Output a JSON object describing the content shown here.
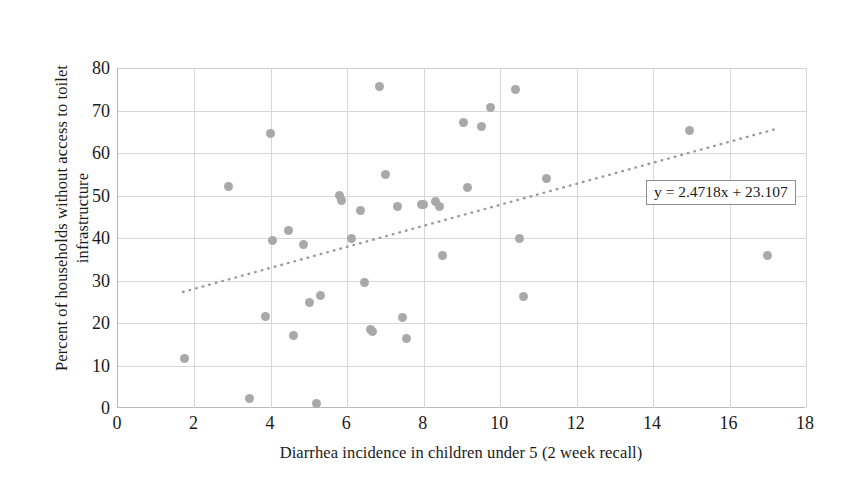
{
  "chart_data": {
    "type": "scatter",
    "title": "",
    "xlabel": "Diarrhea incidence in children under 5 (2 week recall)",
    "ylabel_line1": "Percent of households without access to toilet",
    "ylabel_line2": "infrastructure",
    "xlim": [
      0,
      18
    ],
    "ylim": [
      0,
      80
    ],
    "xticks": [
      0,
      2,
      4,
      6,
      8,
      10,
      12,
      14,
      16,
      18
    ],
    "yticks": [
      0,
      10,
      20,
      30,
      40,
      50,
      60,
      70,
      80
    ],
    "grid": true,
    "legend": "none",
    "marker_color": "#a9a9a9",
    "gridline_color": "#d6d6d6",
    "trendline": {
      "equation": "y = 2.4718x + 23.107",
      "slope": 2.4718,
      "intercept": 23.107,
      "style": "dotted",
      "color": "#9a9a9a",
      "x_start": 1.7,
      "x_end": 17.2
    },
    "points": [
      {
        "x": 1.75,
        "y": 11.7
      },
      {
        "x": 2.9,
        "y": 52.2
      },
      {
        "x": 3.45,
        "y": 2.2
      },
      {
        "x": 3.85,
        "y": 21.5
      },
      {
        "x": 4.0,
        "y": 64.7
      },
      {
        "x": 4.05,
        "y": 39.5
      },
      {
        "x": 4.45,
        "y": 41.8
      },
      {
        "x": 4.6,
        "y": 17.0
      },
      {
        "x": 4.85,
        "y": 38.5
      },
      {
        "x": 5.0,
        "y": 24.8
      },
      {
        "x": 5.2,
        "y": 1.0
      },
      {
        "x": 5.3,
        "y": 26.5
      },
      {
        "x": 5.8,
        "y": 50.0
      },
      {
        "x": 5.85,
        "y": 48.8
      },
      {
        "x": 6.1,
        "y": 40.0
      },
      {
        "x": 6.35,
        "y": 46.5
      },
      {
        "x": 6.45,
        "y": 29.5
      },
      {
        "x": 6.6,
        "y": 18.5
      },
      {
        "x": 6.65,
        "y": 18.0
      },
      {
        "x": 6.85,
        "y": 75.7
      },
      {
        "x": 7.0,
        "y": 55.0
      },
      {
        "x": 7.3,
        "y": 47.5
      },
      {
        "x": 7.45,
        "y": 21.2
      },
      {
        "x": 7.55,
        "y": 16.3
      },
      {
        "x": 7.95,
        "y": 47.9
      },
      {
        "x": 8.0,
        "y": 48.0
      },
      {
        "x": 8.3,
        "y": 48.5
      },
      {
        "x": 8.4,
        "y": 47.5
      },
      {
        "x": 8.5,
        "y": 35.8
      },
      {
        "x": 9.05,
        "y": 67.2
      },
      {
        "x": 9.15,
        "y": 51.8
      },
      {
        "x": 9.5,
        "y": 66.3
      },
      {
        "x": 9.75,
        "y": 70.6
      },
      {
        "x": 10.4,
        "y": 75.0
      },
      {
        "x": 10.5,
        "y": 39.8
      },
      {
        "x": 10.6,
        "y": 26.2
      },
      {
        "x": 11.2,
        "y": 54.0
      },
      {
        "x": 14.95,
        "y": 65.3
      },
      {
        "x": 17.0,
        "y": 35.8
      }
    ]
  }
}
